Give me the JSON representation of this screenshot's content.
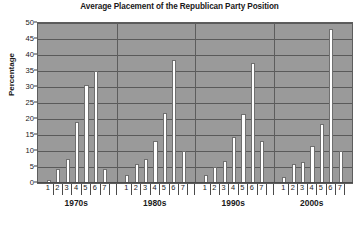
{
  "chart_data": {
    "type": "bar",
    "title": "Average Placement of the Republican Party Position",
    "xlabel": "",
    "ylabel": "Percentage",
    "ylim": [
      0,
      50
    ],
    "ytick_step": 5,
    "yticks": [
      0,
      5,
      10,
      15,
      20,
      25,
      30,
      35,
      40,
      45,
      50
    ],
    "grid": true,
    "legend": "none",
    "group_labels": [
      "1970s",
      "1980s",
      "1990s",
      "2000s"
    ],
    "categories": [
      "1",
      "2",
      "3",
      "4",
      "5",
      "6",
      "7"
    ],
    "series": [
      {
        "name": "1970s",
        "values": [
          1,
          4.5,
          7.5,
          19,
          30.5,
          35,
          4.5
        ]
      },
      {
        "name": "1980s",
        "values": [
          2.5,
          6,
          7.5,
          13,
          22,
          38.5,
          10
        ]
      },
      {
        "name": "1990s",
        "values": [
          2.5,
          5,
          7,
          14.5,
          21.5,
          37.5,
          13
        ]
      },
      {
        "name": "2000s",
        "values": [
          2,
          6,
          6.5,
          11.5,
          18.5,
          48,
          10
        ]
      }
    ],
    "colors": {
      "plot_background": "#9a9a9a",
      "bar_fill": "#ffffff",
      "bar_edge": "#6f6f6f",
      "gridline": "#5a5a5a",
      "axis": "#4a4a4a",
      "text": "#1a1a1a",
      "figure_background": "#ffffff"
    }
  }
}
